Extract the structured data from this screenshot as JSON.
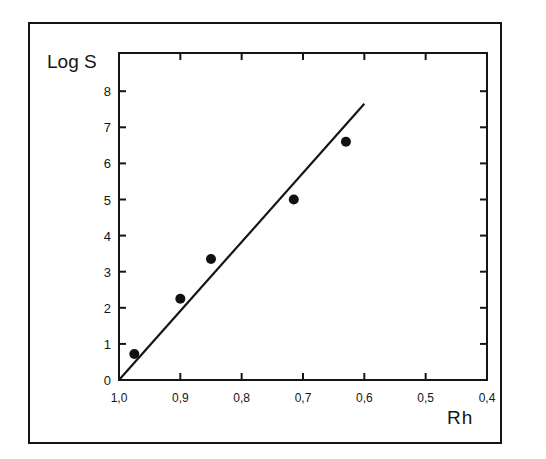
{
  "chart_data": {
    "type": "scatter",
    "title": "",
    "xlabel": "Rh",
    "ylabel": "Log S",
    "xlim": [
      1.0,
      0.4
    ],
    "ylim": [
      0,
      8.5
    ],
    "x_inverted": true,
    "grid": false,
    "legend": null,
    "x_ticks": [
      "1,0",
      "0,9",
      "0,8",
      "0,7",
      "0,6",
      "0,5",
      "0,4"
    ],
    "x_tick_values": [
      1.0,
      0.9,
      0.8,
      0.7,
      0.6,
      0.5,
      0.4
    ],
    "y_ticks": [
      "0",
      "1",
      "2",
      "3",
      "4",
      "5",
      "6",
      "7",
      "8"
    ],
    "y_tick_values": [
      0,
      1,
      2,
      3,
      4,
      5,
      6,
      7,
      8
    ],
    "series": [
      {
        "name": "measured",
        "kind": "scatter",
        "x": [
          0.975,
          0.9,
          0.85,
          0.715,
          0.63
        ],
        "y": [
          0.72,
          2.25,
          3.35,
          5.0,
          6.6
        ]
      },
      {
        "name": "fit line",
        "kind": "line",
        "x": [
          1.0,
          0.6
        ],
        "y": [
          0.0,
          7.65
        ]
      }
    ]
  }
}
